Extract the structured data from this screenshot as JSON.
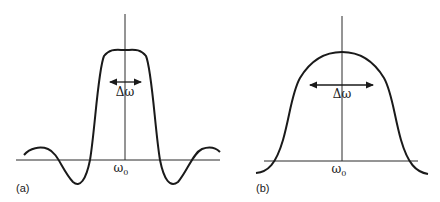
{
  "panels": [
    {
      "id": "a",
      "label": "(a)",
      "center_label": "ω",
      "center_sub": "0",
      "width_label": "Δω",
      "description": "sinc-like spectrum with side lobes"
    },
    {
      "id": "b",
      "label": "(b)",
      "center_label": "ω",
      "center_sub": "0",
      "width_label": "Δω",
      "description": "smooth bell-shaped spectrum without side lobes"
    }
  ],
  "colors": {
    "line": "#1a1a1a",
    "axis": "#2a2a2a",
    "background": "#ffffff"
  }
}
